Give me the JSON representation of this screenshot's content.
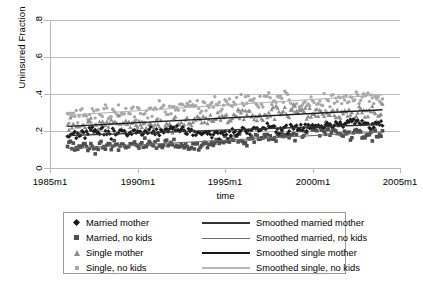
{
  "chart_data": {
    "type": "scatter",
    "title": "",
    "xlabel": "time",
    "ylabel": "Uninsured Fraction",
    "xtick_labels": [
      "1985m1",
      "1990m1",
      "1995m1",
      "2000m1",
      "2005m1"
    ],
    "xtick_values": [
      1985,
      1990,
      1995,
      2000,
      2005
    ],
    "ytick_labels": [
      "0",
      ".2",
      ".4",
      ".6",
      ".8"
    ],
    "ytick_values": [
      0,
      0.2,
      0.4,
      0.6,
      0.8
    ],
    "xlim": [
      1985,
      2005
    ],
    "ylim": [
      0,
      0.8
    ],
    "grid": "horizontal",
    "legend_position": "below-plot",
    "colors": {
      "married_mother": "#1a1a1a",
      "married_no_kids": "#4f4f4f",
      "single_mother": "#8c8c8c",
      "single_no_kids": "#a8a8a8",
      "smoothed_married_mother": "#333333",
      "smoothed_married_no_kids": "#6e6e6e",
      "smoothed_single_mother": "#1a1a1a",
      "smoothed_single_no_kids": "#b0b0b0",
      "gridline": "#b9b9b9",
      "legend_border": "#9a9a9a",
      "background": "#ffffff"
    },
    "series": [
      {
        "name": "Married mother",
        "marker": "diamond",
        "color": "#1a1a1a",
        "x_start": 1986.0,
        "x_end": 2004.0,
        "n_points": 217,
        "level_start": 0.175,
        "level_end": 0.235,
        "scatter_sd": 0.022
      },
      {
        "name": "Married, no kids",
        "marker": "square",
        "color": "#4f4f4f",
        "x_start": 1986.0,
        "x_end": 2004.0,
        "n_points": 217,
        "level_start": 0.105,
        "level_end": 0.195,
        "scatter_sd": 0.026
      },
      {
        "name": "Single mother",
        "marker": "triangle",
        "color": "#8c8c8c",
        "x_start": 1986.0,
        "x_end": 2004.0,
        "n_points": 217,
        "level_start": 0.225,
        "level_end": 0.315,
        "scatter_sd": 0.032
      },
      {
        "name": "Single, no kids",
        "marker": "dot",
        "color": "#a8a8a8",
        "x_start": 1986.0,
        "x_end": 2004.0,
        "n_points": 217,
        "level_start": 0.285,
        "level_end": 0.395,
        "scatter_sd": 0.038
      }
    ],
    "smoothed_lines": [
      {
        "name": "Smoothed married mother",
        "color": "#333333",
        "y_start": 0.175,
        "y_end": 0.235
      },
      {
        "name": "Smoothed married, no kids",
        "color": "#6e6e6e",
        "y_start": 0.105,
        "y_end": 0.195
      },
      {
        "name": "Smoothed single mother",
        "color": "#1a1a1a",
        "y_start": 0.225,
        "y_end": 0.315
      },
      {
        "name": "Smoothed single, no kids",
        "color": "#b0b0b0",
        "y_start": 0.285,
        "y_end": 0.395
      }
    ]
  },
  "axes": {
    "y_title": "Uninsured Fraction",
    "x_title": "time",
    "y_ticks": [
      "0",
      ".2",
      ".4",
      ".6",
      ".8"
    ],
    "x_ticks": [
      "1985m1",
      "1990m1",
      "1995m1",
      "2000m1",
      "2005m1"
    ]
  },
  "legend": {
    "rows": [
      {
        "marker": "diamond",
        "label": "Married mother",
        "line_label": "Smoothed married mother"
      },
      {
        "marker": "square",
        "label": "Married, no kids",
        "line_label": "Smoothed married, no kids"
      },
      {
        "marker": "triangle",
        "label": "Single mother",
        "line_label": "Smoothed single mother"
      },
      {
        "marker": "dot",
        "label": "Single, no kids",
        "line_label": "Smoothed single, no kids"
      }
    ]
  }
}
